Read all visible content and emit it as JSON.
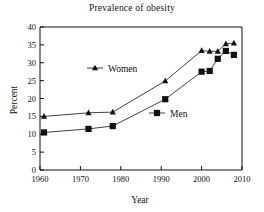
{
  "chart_data": {
    "type": "line",
    "title": "Prevalence of obesity",
    "xlabel": "Year",
    "ylabel": "Percent",
    "xlim": [
      1960,
      2010
    ],
    "ylim": [
      0,
      40
    ],
    "xticks": [
      1960,
      1970,
      1980,
      1990,
      2000,
      2010
    ],
    "yticks": [
      0,
      5,
      10,
      15,
      20,
      25,
      30,
      35,
      40
    ],
    "grid": false,
    "legend_position": "inside",
    "series": [
      {
        "name": "Women",
        "marker": "triangle",
        "x": [
          1961,
          1972,
          1978,
          1991,
          2000,
          2002,
          2004,
          2006,
          2008
        ],
        "values": [
          15.0,
          16.0,
          16.2,
          24.9,
          33.4,
          33.2,
          33.2,
          35.3,
          35.5
        ]
      },
      {
        "name": "Men",
        "marker": "square",
        "x": [
          1961,
          1972,
          1978,
          1991,
          2000,
          2002,
          2004,
          2006,
          2008
        ],
        "values": [
          10.5,
          11.5,
          12.3,
          19.8,
          27.5,
          27.7,
          31.1,
          33.3,
          32.2
        ]
      }
    ]
  },
  "legend": {
    "women_label": "Women",
    "men_label": "Men"
  },
  "colors": {
    "axis": "#111111",
    "series": "#111111",
    "background": "#ffffff"
  }
}
